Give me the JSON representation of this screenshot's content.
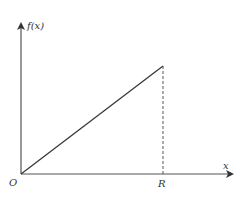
{
  "diagram": {
    "y_axis_label": "f(x)",
    "x_axis_label": "x",
    "origin_label": "O",
    "point_label": "R",
    "colors": {
      "axis": "#555555",
      "line": "#333333",
      "dashed": "#555555",
      "text": "#333333"
    }
  }
}
